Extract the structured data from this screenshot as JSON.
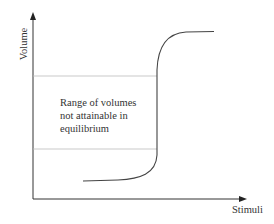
{
  "diagram": {
    "type": "sigmoid-step-curve",
    "y_axis_label": "Volume",
    "x_axis_label": "Stimuli",
    "annotation": {
      "line1": "Range of volumes",
      "line2": "not attainable in",
      "line3": "equilibrium"
    },
    "colors": {
      "axis": "#333333",
      "curve": "#444444",
      "guide_lines": "#bbbbbb"
    }
  }
}
